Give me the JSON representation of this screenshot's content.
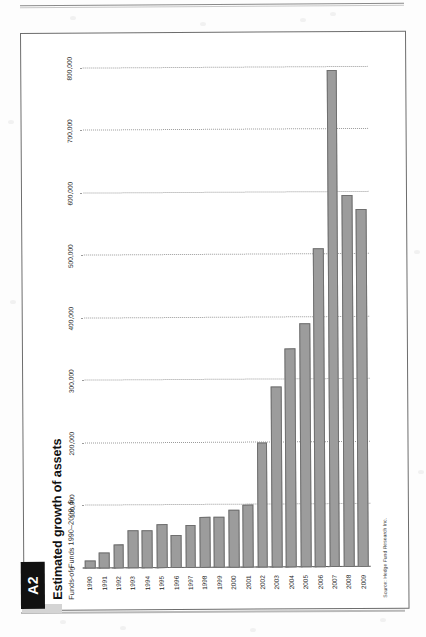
{
  "page": {
    "tag": "A2",
    "title": "Estimated growth of assets",
    "subtitle": "Funds-of-Funds 1990–2009, $",
    "source": "Source: Hedge Fund Research Inc."
  },
  "chart_data": {
    "type": "bar",
    "orientation": "horizontal",
    "title": "Estimated growth of assets",
    "subtitle": "Funds-of-Funds 1990–2009, $",
    "xlabel": "",
    "ylabel": "",
    "xlim": [
      0,
      800000
    ],
    "grid": true,
    "legend": false,
    "source": "Source: Hedge Fund Research Inc.",
    "axis_ticks": [
      "0",
      "100,000",
      "200,000",
      "300,000",
      "400,000",
      "500,000",
      "600,000",
      "700,000",
      "800,000"
    ],
    "axis_tick_values": [
      0,
      100000,
      200000,
      300000,
      400000,
      500000,
      600000,
      700000,
      800000
    ],
    "categories": [
      "1990",
      "1991",
      "1992",
      "1993",
      "1994",
      "1995",
      "1996",
      "1997",
      "1998",
      "1999",
      "2000",
      "2001",
      "2002",
      "2003",
      "2004",
      "2005",
      "2006",
      "2007",
      "2008",
      "2009"
    ],
    "values": [
      12000,
      26000,
      38000,
      60000,
      60000,
      70000,
      52000,
      68000,
      82000,
      82000,
      92000,
      100000,
      200000,
      289000,
      350000,
      390000,
      511000,
      795000,
      595000,
      572000
    ],
    "bar_color": "#9c9c9c",
    "bar_edge_color": "#6f6f6f"
  }
}
